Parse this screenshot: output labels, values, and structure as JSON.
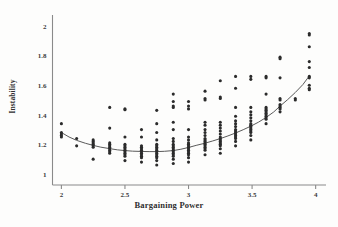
{
  "chart_data": {
    "type": "scatter",
    "title": "",
    "xlabel": "Bargaining Power",
    "ylabel": "Instability",
    "xlim": [
      1.93,
      4.05
    ],
    "ylim": [
      0.93,
      2.06
    ],
    "xticks": [
      "2",
      "2.5",
      "3",
      "3.5",
      "4"
    ],
    "xtick_values": [
      2,
      2.5,
      3,
      3.5,
      4
    ],
    "yticks": [
      "1",
      "1.2",
      "1.4",
      "1.6",
      "1.8",
      "2"
    ],
    "ytick_values": [
      1,
      1.2,
      1.4,
      1.6,
      1.8,
      2
    ],
    "grid": false,
    "legend": "none",
    "marker_color": "#2b2b2b",
    "line_color": "#5a5a5a",
    "axis_color": "#8a8a8a",
    "background_color": "#fdfdfc",
    "series": [
      {
        "name": "Instability observations",
        "type": "scatter",
        "points": [
          [
            2.0,
            1.345
          ],
          [
            2.0,
            1.285
          ],
          [
            2.0,
            1.275
          ],
          [
            2.0,
            1.265
          ],
          [
            2.0,
            1.255
          ],
          [
            2.12,
            1.245
          ],
          [
            2.12,
            1.195
          ],
          [
            2.25,
            1.235
          ],
          [
            2.25,
            1.225
          ],
          [
            2.25,
            1.215
          ],
          [
            2.25,
            1.205
          ],
          [
            2.25,
            1.195
          ],
          [
            2.25,
            1.185
          ],
          [
            2.25,
            1.105
          ],
          [
            2.38,
            1.455
          ],
          [
            2.38,
            1.315
          ],
          [
            2.38,
            1.215
          ],
          [
            2.38,
            1.205
          ],
          [
            2.38,
            1.195
          ],
          [
            2.38,
            1.185
          ],
          [
            2.38,
            1.175
          ],
          [
            2.38,
            1.165
          ],
          [
            2.38,
            1.155
          ],
          [
            2.38,
            1.145
          ],
          [
            2.5,
            1.445
          ],
          [
            2.5,
            1.44
          ],
          [
            2.5,
            1.255
          ],
          [
            2.5,
            1.205
          ],
          [
            2.5,
            1.195
          ],
          [
            2.5,
            1.185
          ],
          [
            2.5,
            1.175
          ],
          [
            2.5,
            1.165
          ],
          [
            2.5,
            1.155
          ],
          [
            2.5,
            1.145
          ],
          [
            2.5,
            1.135
          ],
          [
            2.5,
            1.125
          ],
          [
            2.5,
            1.095
          ],
          [
            2.63,
            1.305
          ],
          [
            2.63,
            1.255
          ],
          [
            2.63,
            1.195
          ],
          [
            2.63,
            1.185
          ],
          [
            2.63,
            1.175
          ],
          [
            2.63,
            1.165
          ],
          [
            2.63,
            1.155
          ],
          [
            2.63,
            1.145
          ],
          [
            2.63,
            1.135
          ],
          [
            2.63,
            1.125
          ],
          [
            2.63,
            1.115
          ],
          [
            2.63,
            1.085
          ],
          [
            2.75,
            1.435
          ],
          [
            2.75,
            1.345
          ],
          [
            2.75,
            1.285
          ],
          [
            2.75,
            1.235
          ],
          [
            2.75,
            1.205
          ],
          [
            2.75,
            1.195
          ],
          [
            2.75,
            1.185
          ],
          [
            2.75,
            1.175
          ],
          [
            2.75,
            1.165
          ],
          [
            2.75,
            1.155
          ],
          [
            2.75,
            1.145
          ],
          [
            2.75,
            1.135
          ],
          [
            2.75,
            1.125
          ],
          [
            2.75,
            1.115
          ],
          [
            2.75,
            1.095
          ],
          [
            2.75,
            1.065
          ],
          [
            2.88,
            1.545
          ],
          [
            2.88,
            1.495
          ],
          [
            2.88,
            1.465
          ],
          [
            2.88,
            1.455
          ],
          [
            2.88,
            1.355
          ],
          [
            2.88,
            1.305
          ],
          [
            2.88,
            1.245
          ],
          [
            2.88,
            1.225
          ],
          [
            2.88,
            1.205
          ],
          [
            2.88,
            1.195
          ],
          [
            2.88,
            1.185
          ],
          [
            2.88,
            1.175
          ],
          [
            2.88,
            1.165
          ],
          [
            2.88,
            1.155
          ],
          [
            2.88,
            1.145
          ],
          [
            2.88,
            1.135
          ],
          [
            2.88,
            1.125
          ],
          [
            2.88,
            1.105
          ],
          [
            2.88,
            1.075
          ],
          [
            3.0,
            1.495
          ],
          [
            3.0,
            1.465
          ],
          [
            3.0,
            1.445
          ],
          [
            3.0,
            1.305
          ],
          [
            3.0,
            1.255
          ],
          [
            3.0,
            1.235
          ],
          [
            3.0,
            1.215
          ],
          [
            3.0,
            1.205
          ],
          [
            3.0,
            1.195
          ],
          [
            3.0,
            1.185
          ],
          [
            3.0,
            1.175
          ],
          [
            3.0,
            1.165
          ],
          [
            3.0,
            1.155
          ],
          [
            3.0,
            1.145
          ],
          [
            3.0,
            1.135
          ],
          [
            3.0,
            1.115
          ],
          [
            3.0,
            1.085
          ],
          [
            3.13,
            1.565
          ],
          [
            3.13,
            1.515
          ],
          [
            3.13,
            1.505
          ],
          [
            3.13,
            1.355
          ],
          [
            3.13,
            1.335
          ],
          [
            3.13,
            1.305
          ],
          [
            3.13,
            1.285
          ],
          [
            3.13,
            1.265
          ],
          [
            3.13,
            1.245
          ],
          [
            3.13,
            1.235
          ],
          [
            3.13,
            1.225
          ],
          [
            3.13,
            1.215
          ],
          [
            3.13,
            1.205
          ],
          [
            3.13,
            1.195
          ],
          [
            3.13,
            1.185
          ],
          [
            3.13,
            1.175
          ],
          [
            3.13,
            1.165
          ],
          [
            3.13,
            1.135
          ],
          [
            3.25,
            1.635
          ],
          [
            3.25,
            1.525
          ],
          [
            3.25,
            1.515
          ],
          [
            3.25,
            1.355
          ],
          [
            3.25,
            1.335
          ],
          [
            3.25,
            1.315
          ],
          [
            3.25,
            1.295
          ],
          [
            3.25,
            1.275
          ],
          [
            3.25,
            1.255
          ],
          [
            3.25,
            1.245
          ],
          [
            3.25,
            1.235
          ],
          [
            3.25,
            1.225
          ],
          [
            3.25,
            1.215
          ],
          [
            3.25,
            1.205
          ],
          [
            3.25,
            1.195
          ],
          [
            3.25,
            1.175
          ],
          [
            3.25,
            1.145
          ],
          [
            3.37,
            1.665
          ],
          [
            3.37,
            1.585
          ],
          [
            3.37,
            1.455
          ],
          [
            3.37,
            1.395
          ],
          [
            3.37,
            1.365
          ],
          [
            3.37,
            1.345
          ],
          [
            3.37,
            1.325
          ],
          [
            3.37,
            1.305
          ],
          [
            3.37,
            1.295
          ],
          [
            3.37,
            1.285
          ],
          [
            3.37,
            1.275
          ],
          [
            3.37,
            1.265
          ],
          [
            3.37,
            1.255
          ],
          [
            3.37,
            1.245
          ],
          [
            3.37,
            1.225
          ],
          [
            3.37,
            1.195
          ],
          [
            3.49,
            1.665
          ],
          [
            3.49,
            1.645
          ],
          [
            3.49,
            1.455
          ],
          [
            3.49,
            1.425
          ],
          [
            3.49,
            1.405
          ],
          [
            3.49,
            1.385
          ],
          [
            3.49,
            1.365
          ],
          [
            3.49,
            1.345
          ],
          [
            3.49,
            1.335
          ],
          [
            3.49,
            1.325
          ],
          [
            3.49,
            1.315
          ],
          [
            3.49,
            1.305
          ],
          [
            3.49,
            1.295
          ],
          [
            3.49,
            1.285
          ],
          [
            3.49,
            1.265
          ],
          [
            3.49,
            1.235
          ],
          [
            3.61,
            1.665
          ],
          [
            3.61,
            1.655
          ],
          [
            3.61,
            1.545
          ],
          [
            3.61,
            1.455
          ],
          [
            3.61,
            1.445
          ],
          [
            3.61,
            1.435
          ],
          [
            3.61,
            1.425
          ],
          [
            3.61,
            1.415
          ],
          [
            3.61,
            1.405
          ],
          [
            3.61,
            1.395
          ],
          [
            3.61,
            1.385
          ],
          [
            3.61,
            1.375
          ],
          [
            3.61,
            1.345
          ],
          [
            3.72,
            1.795
          ],
          [
            3.72,
            1.785
          ],
          [
            3.72,
            1.655
          ],
          [
            3.72,
            1.515
          ],
          [
            3.72,
            1.505
          ],
          [
            3.72,
            1.475
          ],
          [
            3.72,
            1.465
          ],
          [
            3.72,
            1.455
          ],
          [
            3.72,
            1.445
          ],
          [
            3.72,
            1.425
          ],
          [
            3.84,
            1.515
          ],
          [
            3.84,
            1.505
          ],
          [
            3.95,
            1.955
          ],
          [
            3.95,
            1.945
          ],
          [
            3.95,
            1.865
          ],
          [
            3.95,
            1.765
          ],
          [
            3.95,
            1.725
          ],
          [
            3.95,
            1.665
          ],
          [
            3.95,
            1.655
          ],
          [
            3.95,
            1.605
          ],
          [
            3.95,
            1.585
          ],
          [
            3.95,
            1.575
          ]
        ]
      },
      {
        "name": "Fitted trend curve",
        "type": "line",
        "points": [
          [
            2.0,
            1.285
          ],
          [
            2.06,
            1.255
          ],
          [
            2.12,
            1.232
          ],
          [
            2.19,
            1.212
          ],
          [
            2.25,
            1.198
          ],
          [
            2.31,
            1.186
          ],
          [
            2.38,
            1.176
          ],
          [
            2.44,
            1.168
          ],
          [
            2.5,
            1.163
          ],
          [
            2.56,
            1.159
          ],
          [
            2.63,
            1.157
          ],
          [
            2.69,
            1.156
          ],
          [
            2.75,
            1.156
          ],
          [
            2.81,
            1.158
          ],
          [
            2.88,
            1.163
          ],
          [
            2.94,
            1.172
          ],
          [
            3.0,
            1.184
          ],
          [
            3.06,
            1.198
          ],
          [
            3.13,
            1.213
          ],
          [
            3.19,
            1.228
          ],
          [
            3.25,
            1.244
          ],
          [
            3.31,
            1.262
          ],
          [
            3.37,
            1.282
          ],
          [
            3.43,
            1.304
          ],
          [
            3.49,
            1.328
          ],
          [
            3.55,
            1.355
          ],
          [
            3.61,
            1.387
          ],
          [
            3.67,
            1.424
          ],
          [
            3.72,
            1.464
          ],
          [
            3.78,
            1.508
          ],
          [
            3.84,
            1.556
          ],
          [
            3.9,
            1.61
          ],
          [
            3.95,
            1.668
          ]
        ]
      }
    ]
  }
}
